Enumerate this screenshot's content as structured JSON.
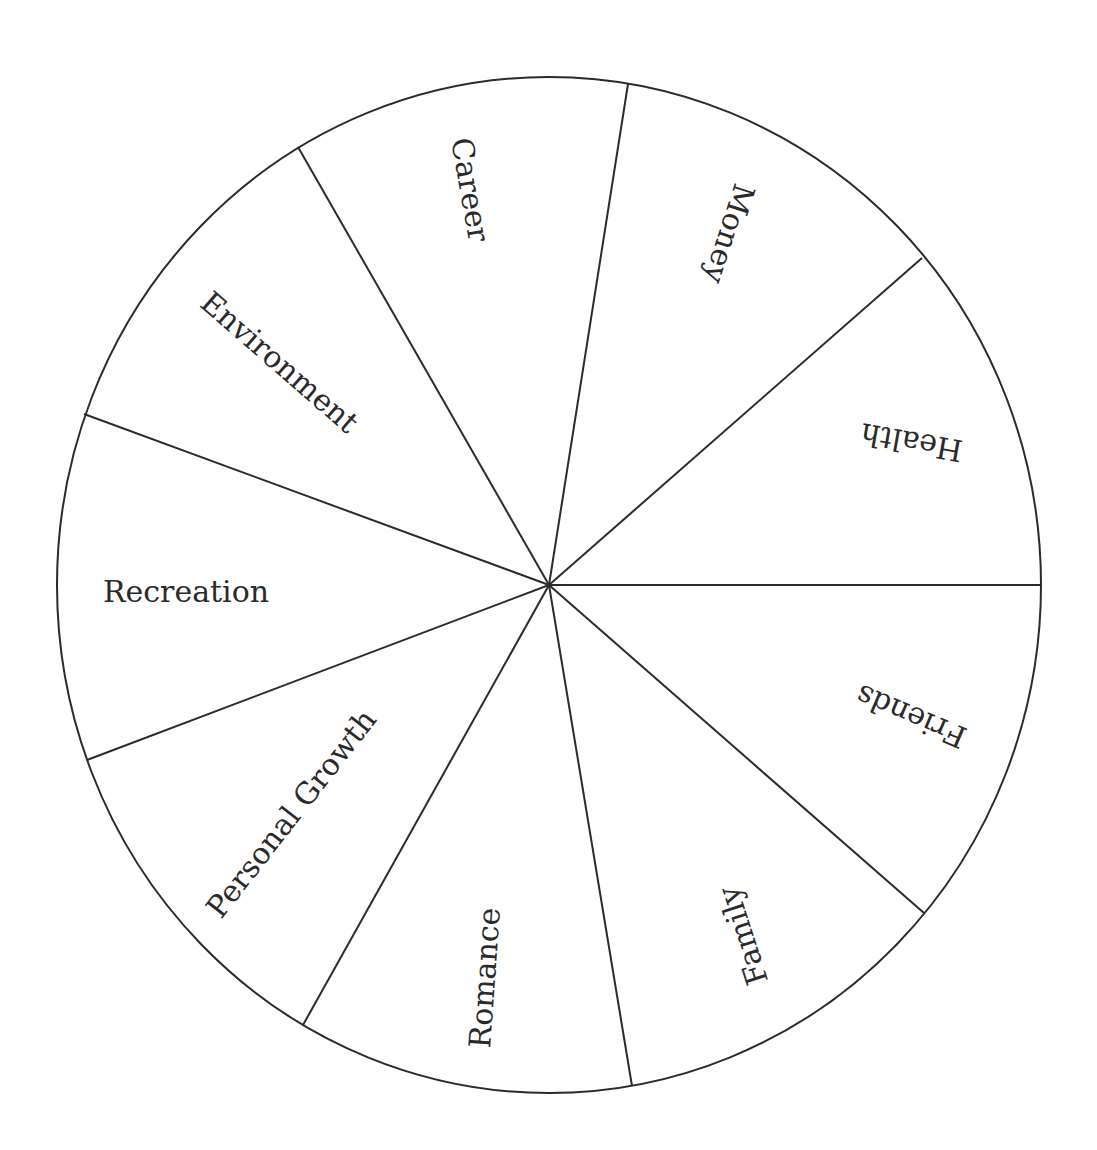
{
  "diagram": {
    "type": "wheel-of-life",
    "segments": [
      {
        "label": "Career"
      },
      {
        "label": "Money"
      },
      {
        "label": "Health"
      },
      {
        "label": "Friends"
      },
      {
        "label": "Family"
      },
      {
        "label": "Romance"
      },
      {
        "label": "Personal Growth"
      },
      {
        "label": "Recreation"
      },
      {
        "label": "Environment"
      }
    ]
  },
  "colors": {
    "line": "#2b2b2b",
    "text": "#2a2a2a",
    "background": "#ffffff"
  }
}
